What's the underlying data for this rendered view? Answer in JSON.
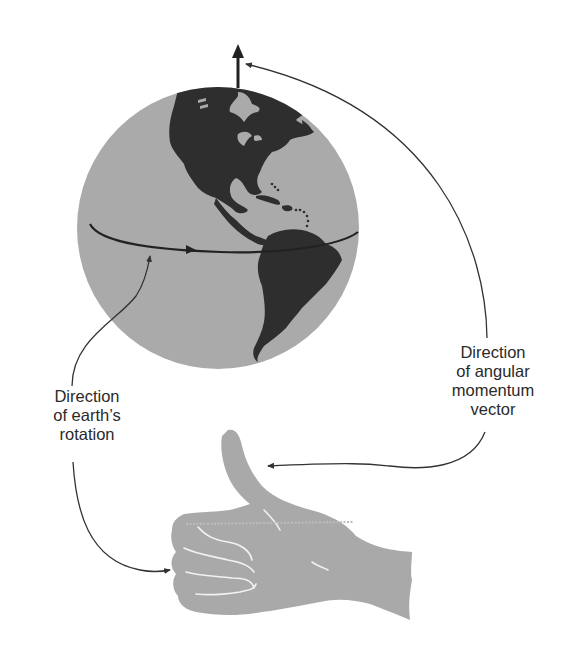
{
  "diagram": {
    "type": "physics-illustration",
    "labels": {
      "rotation": {
        "lines": [
          "Direction",
          "of earth’s",
          "rotation"
        ]
      },
      "angular_momentum": {
        "lines": [
          "Direction",
          "of angular",
          "momentum",
          "vector"
        ]
      }
    },
    "elements": {
      "globe": "Earth globe showing the Americas, with equator line and rotation arrow",
      "axis_arrow": "Upward arrow from north pole (angular momentum vector)",
      "hand": "Right hand in thumbs-up pose; curled fingers follow rotation, thumb points along angular momentum"
    },
    "colors": {
      "ocean": "#aaaaaa",
      "land": "#2e2e2e",
      "hand": "#a9a9a9",
      "lines": "#333333",
      "text": "#2a2a2a",
      "background": "#ffffff"
    }
  }
}
